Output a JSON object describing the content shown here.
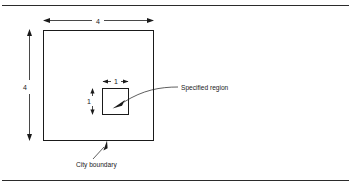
{
  "figure": {
    "type": "technical-diagram",
    "title": "",
    "background_color": "#ffffff",
    "ink_color": "#1a1a1a",
    "rule_color": "#2b2b2b"
  },
  "shapes": {
    "city_boundary_square": {
      "name": "City boundary",
      "side_length": "4"
    },
    "specified_region_square": {
      "name": "Specified region",
      "side_length": "1"
    }
  },
  "dimensions": {
    "outer_top": "4",
    "outer_left": "4",
    "inner_top": "1",
    "inner_left": "1"
  },
  "callouts": {
    "specified_region": "Specified region",
    "city_boundary": "City boundary"
  }
}
